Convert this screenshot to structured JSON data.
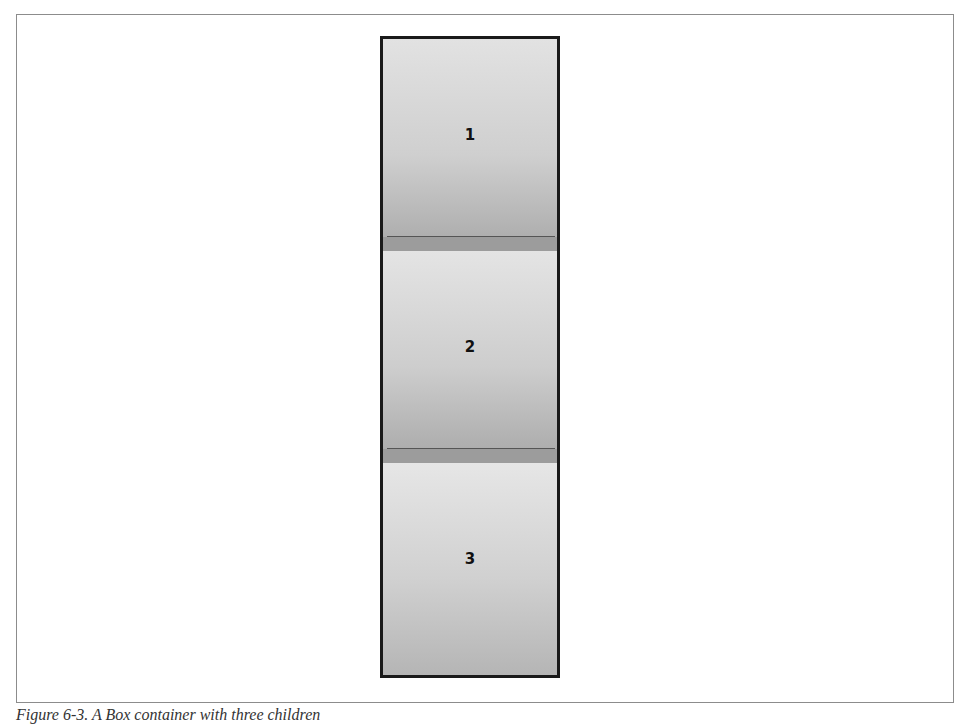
{
  "figure": {
    "caption": "Figure 6-3. A Box container with three children"
  },
  "box": {
    "orientation": "vertical",
    "children": [
      {
        "label": "1"
      },
      {
        "label": "2"
      },
      {
        "label": "3"
      }
    ],
    "border_color": "#1a1a1a",
    "panel_color": "#cccccc"
  }
}
